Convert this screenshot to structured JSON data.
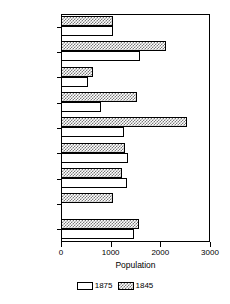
{
  "chart_data": {
    "type": "bar",
    "orientation": "horizontal",
    "title": "",
    "xlabel": "Population",
    "ylabel": "",
    "xlim": [
      0,
      3000
    ],
    "xticks": [
      0,
      1000,
      2000,
      3000
    ],
    "xtick_labels": [
      "0",
      "1000",
      "2000",
      "3000"
    ],
    "grid": false,
    "legend_position": "bottom",
    "categories": [
      "Bolton",
      "Chester",
      "Hague",
      "Horicon",
      "Johnsburg",
      "Lake Luzerne",
      "Stony Creek",
      "Thurman",
      "Warrensburg"
    ],
    "series": [
      {
        "name": "1875",
        "fill": "white",
        "values": [
          1040,
          1590,
          540,
          800,
          1270,
          1350,
          1330,
          0,
          1470
        ]
      },
      {
        "name": "1845",
        "fill": "stipple-gray",
        "values": [
          1040,
          2110,
          640,
          1530,
          2530,
          1290,
          1230,
          1050,
          1570
        ]
      }
    ]
  },
  "legend": {
    "entries": [
      {
        "label": "1875",
        "swatch": "white-swatch"
      },
      {
        "label": "1845",
        "swatch": "stipple-swatch"
      }
    ]
  },
  "axis": {
    "x_title": "Population",
    "tick_labels": [
      "0",
      "1000",
      "2000",
      "3000"
    ]
  },
  "colors": {
    "axis": "#000000",
    "bar_1875_fill": "#ffffff",
    "bar_1845_fill": "#7a7a7a",
    "background": "#ffffff"
  }
}
